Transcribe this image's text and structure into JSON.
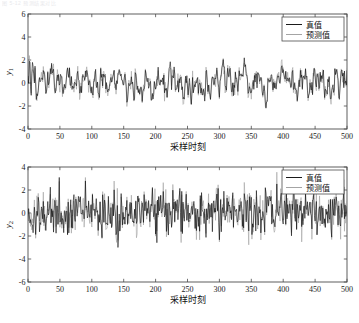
{
  "figure": {
    "faint_caption": "图 5-12  预测结果对比",
    "background_color": "#ffffff",
    "true_color": "#000000",
    "pred_color": "#9a9a9a"
  },
  "chart_data": [
    {
      "type": "line",
      "title": "",
      "xlabel": "采样时刻",
      "ylabel": "y₁",
      "ylabel_base": "y",
      "ylabel_sub": "1",
      "xlim": [
        0,
        500
      ],
      "ylim": [
        -4,
        6
      ],
      "xticks": [
        0,
        50,
        100,
        150,
        200,
        250,
        300,
        350,
        400,
        450,
        500
      ],
      "xticklabels": [
        "0",
        "50",
        "100",
        "150",
        "200",
        "250",
        "300",
        "350",
        "400",
        "450",
        "500"
      ],
      "yticks": [
        -4,
        -2,
        0,
        2,
        4,
        6
      ],
      "yticklabels": [
        "-4",
        "-2",
        "0",
        "2",
        "4",
        "6"
      ],
      "grid": false,
      "legend_position": "upper right",
      "series": [
        {
          "name": "真值",
          "color": "#000000",
          "seed": 11,
          "sigma": 1.0,
          "smooth": 0.62,
          "amp": 1.55,
          "offset": 0.0
        },
        {
          "name": "预测值",
          "color": "#9a9a9a",
          "seed": 11,
          "sigma": 1.0,
          "smooth": 0.62,
          "amp": 1.55,
          "offset": 0.0,
          "noise": 0.3
        }
      ]
    },
    {
      "type": "line",
      "title": "",
      "xlabel": "采样时刻",
      "ylabel": "y₂",
      "ylabel_base": "y",
      "ylabel_sub": "2",
      "xlim": [
        0,
        500
      ],
      "ylim": [
        -6,
        4
      ],
      "xticks": [
        0,
        50,
        100,
        150,
        200,
        250,
        300,
        350,
        400,
        450,
        500
      ],
      "xticklabels": [
        "0",
        "50",
        "100",
        "150",
        "200",
        "250",
        "300",
        "350",
        "400",
        "450",
        "500"
      ],
      "yticks": [
        -6,
        -4,
        -2,
        0,
        2,
        4
      ],
      "yticklabels": [
        "-6",
        "-4",
        "-2",
        "0",
        "2",
        "4"
      ],
      "grid": false,
      "legend_position": "upper right",
      "series": [
        {
          "name": "真值",
          "color": "#000000",
          "seed": 77,
          "sigma": 1.0,
          "smooth": 0.05,
          "amp": 0.98,
          "offset": 0.0
        },
        {
          "name": "预测值",
          "color": "#9a9a9a",
          "seed": 77,
          "sigma": 1.0,
          "smooth": 0.05,
          "amp": 0.98,
          "offset": 0.0,
          "noise": 0.55
        }
      ]
    }
  ]
}
